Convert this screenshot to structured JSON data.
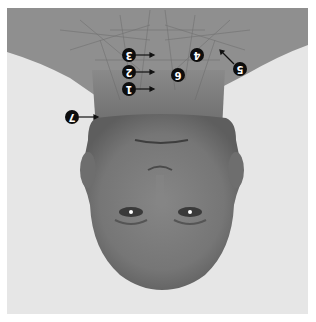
{
  "image": {
    "description": "Upside-down grayscale photo of a bald head with overlaid neck muscle anatomy and numbered callouts",
    "orientation": "rotated-180",
    "colors": {
      "background": "#e6e6e6",
      "shoulders": "#8f8f8f",
      "skin": "#7a7a7a",
      "label_fill": "#0d0d0d",
      "label_text": "#ffffff"
    }
  },
  "callouts": [
    {
      "number": "1",
      "x": 129,
      "y": 89,
      "arrow": "right"
    },
    {
      "number": "2",
      "x": 129,
      "y": 72,
      "arrow": "right"
    },
    {
      "number": "3",
      "x": 129,
      "y": 55,
      "arrow": "right"
    },
    {
      "number": "4",
      "x": 197,
      "y": 55,
      "arrow": "none"
    },
    {
      "number": "5",
      "x": 240,
      "y": 69,
      "arrow": "up-left"
    },
    {
      "number": "6",
      "x": 178,
      "y": 75,
      "arrow": "none"
    },
    {
      "number": "7",
      "x": 72,
      "y": 117,
      "arrow": "right"
    }
  ]
}
